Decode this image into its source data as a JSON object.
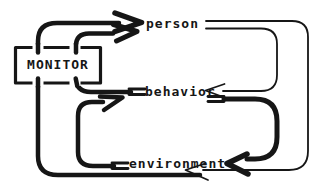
{
  "diagram": {
    "kind": "feedback-loop-diagram",
    "monitor": {
      "label": "MONITOR"
    },
    "nodes": [
      {
        "id": "monitor",
        "label": "MONITOR"
      },
      {
        "id": "person",
        "label": "person"
      },
      {
        "id": "behavior",
        "label": "behavior"
      },
      {
        "id": "environment",
        "label": "environment"
      }
    ],
    "edges": [
      {
        "from": "environment",
        "to": "person",
        "style": "thick",
        "via": "monitor",
        "side": "left"
      },
      {
        "from": "behavior",
        "to": "person",
        "style": "thick",
        "via": "monitor",
        "side": "left"
      },
      {
        "from": "environment",
        "to": "behavior",
        "style": "thick",
        "via": null,
        "side": "left"
      },
      {
        "from": "behavior",
        "to": "environment",
        "style": "thick",
        "via": null,
        "side": "right"
      },
      {
        "from": "person",
        "to": "behavior",
        "style": "thin",
        "via": null,
        "side": "right"
      },
      {
        "from": "person",
        "to": "environment",
        "style": "thin",
        "via": null,
        "side": "right"
      }
    ],
    "colors": {
      "ink": "#161616",
      "paper": "#ffffff"
    }
  }
}
